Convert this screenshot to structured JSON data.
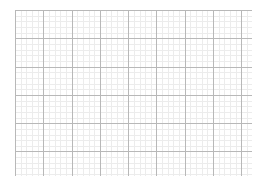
{
  "graph_paper": {
    "background": "#ffffff",
    "minor_line_color": "#ececec",
    "major_line_color": "#b8b8b8",
    "origin_x": 15,
    "origin_y": 10,
    "right_edge": 252,
    "bottom_edge": 176,
    "major_spacing": 28.3,
    "minor_divisions": 5
  }
}
